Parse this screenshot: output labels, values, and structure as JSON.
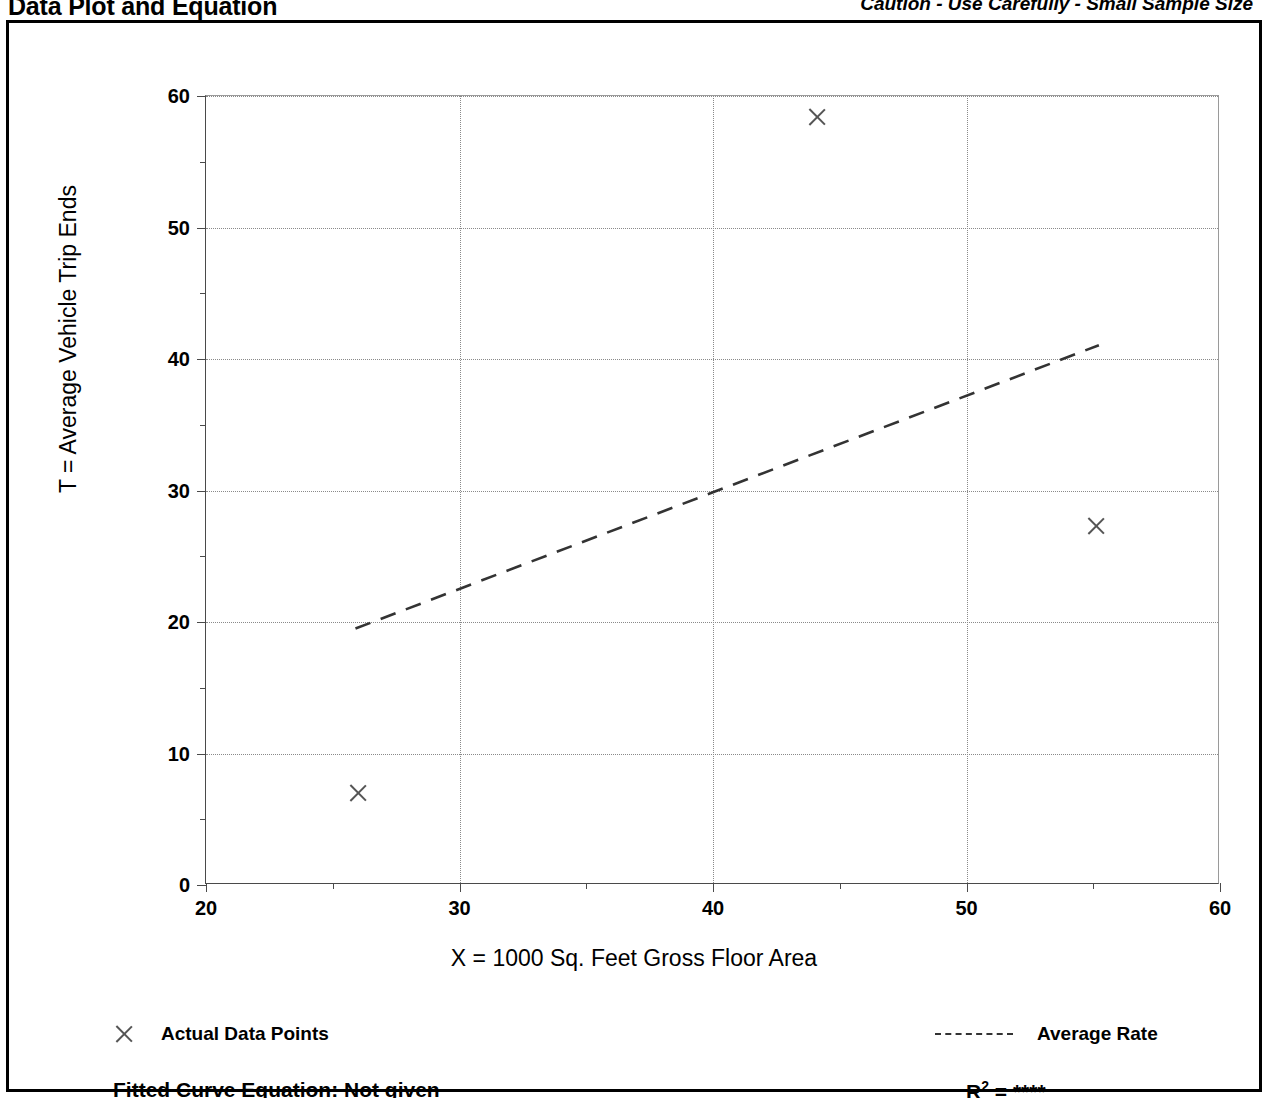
{
  "header": {
    "title": "Data Plot and Equation",
    "caution": "Caution - Use Carefully - Small Sample Size"
  },
  "legend": {
    "data_points_label": "Actual Data Points",
    "average_rate_label": "Average Rate",
    "marker_icon": "x-cross-icon",
    "line_icon": "dashed-line-icon"
  },
  "footer": {
    "equation_label": "Fitted Curve Equation:  Not given",
    "r2_prefix": "R",
    "r2_exponent": "2",
    "r2_value": "= ****"
  },
  "chart_data": {
    "type": "scatter",
    "title": "Data Plot and Equation",
    "xlabel": "X = 1000 Sq. Feet Gross Floor Area",
    "ylabel": "T = Average Vehicle Trip Ends",
    "xlim": [
      20,
      60
    ],
    "ylim": [
      0,
      60
    ],
    "xticks": [
      20,
      30,
      40,
      50,
      60
    ],
    "yticks": [
      0,
      10,
      20,
      30,
      40,
      50,
      60
    ],
    "xticks_minor": [
      25,
      35,
      45,
      55
    ],
    "yticks_minor": [
      5,
      15,
      25,
      35,
      45,
      55
    ],
    "grid": true,
    "legend_position": "below-axes",
    "series": [
      {
        "name": "Actual Data Points",
        "type": "scatter",
        "marker": "x",
        "points": [
          {
            "x": 26.0,
            "y": 7.0
          },
          {
            "x": 44.1,
            "y": 58.4
          },
          {
            "x": 55.1,
            "y": 27.3
          }
        ]
      },
      {
        "name": "Average Rate",
        "type": "line",
        "style": "dashed",
        "points": [
          {
            "x": 25.9,
            "y": 19.4
          },
          {
            "x": 55.3,
            "y": 41.0
          }
        ]
      }
    ],
    "annotations": [
      "Caution - Use Carefully - Small Sample Size",
      "Fitted Curve Equation:  Not given",
      "R2 = ****"
    ]
  }
}
